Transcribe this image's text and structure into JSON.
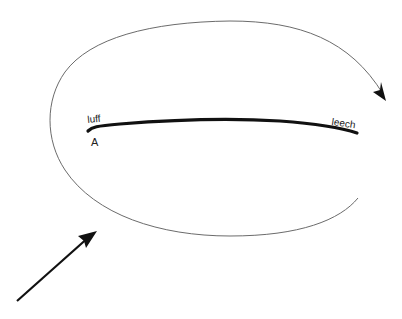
{
  "diagram": {
    "labels": {
      "luff": "luff",
      "leech": "leech",
      "point_a": "A"
    },
    "elements": [
      {
        "name": "sail-chord",
        "description": "thick curved line representing sail from luff to leech"
      },
      {
        "name": "flow-loop",
        "description": "thin elliptical loop with arrowhead at upper right, open at right side"
      },
      {
        "name": "wind-arrow",
        "description": "straight arrow from lower left pointing up-right"
      }
    ],
    "colors": {
      "stroke_thick": "#111111",
      "stroke_thin": "#6b6b6b",
      "background": "#ffffff"
    }
  }
}
